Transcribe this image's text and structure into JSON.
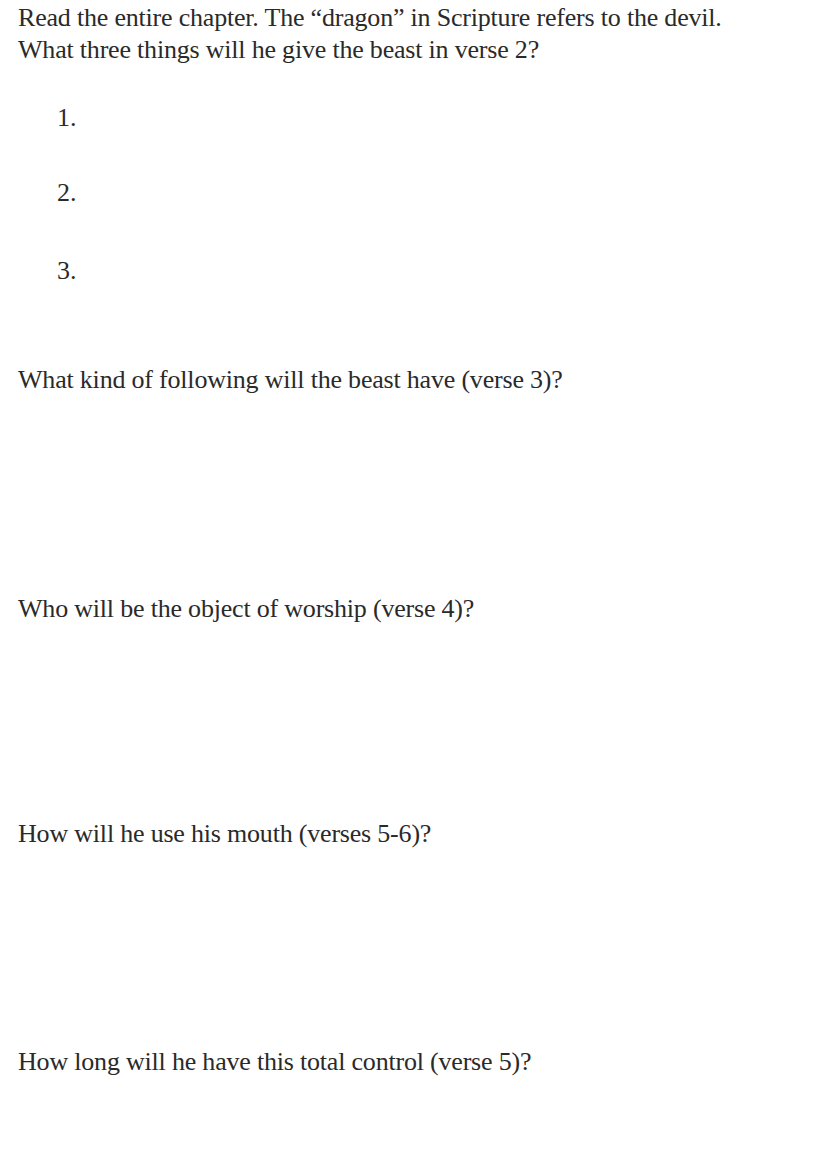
{
  "worksheet": {
    "intro": {
      "line1": "Read the entire chapter. The “dragon” in Scripture refers to the devil.",
      "line2": "What three things will he give the beast in verse 2?"
    },
    "list_items": [
      {
        "number": "1.",
        "answer": ""
      },
      {
        "number": "2.",
        "answer": ""
      },
      {
        "number": "3.",
        "answer": ""
      }
    ],
    "questions": [
      {
        "text": "What kind of following will the beast have (verse 3)?",
        "answer": ""
      },
      {
        "text": "Who will be the object of worship (verse 4)?",
        "answer": ""
      },
      {
        "text": "How will he use his mouth (verses 5-6)?",
        "answer": ""
      },
      {
        "text": "How long will he have this total control (verse 5)?",
        "answer": ""
      }
    ]
  }
}
